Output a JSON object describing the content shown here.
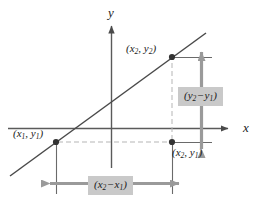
{
  "figure": {
    "type": "slope-diagram",
    "axes": {
      "y_axis_label": "y",
      "x_axis_label": "x"
    },
    "points": [
      {
        "id": "p1",
        "label_prefix": "(",
        "x_var": "x",
        "x_sub": "1",
        "sep": ", ",
        "y_var": "y",
        "y_sub": "1",
        "label_suffix": ")",
        "px": 56,
        "py": 142
      },
      {
        "id": "p2",
        "label_prefix": "(",
        "x_var": "x",
        "x_sub": "2",
        "sep": ", ",
        "y_var": "y",
        "y_sub": "2",
        "label_suffix": ")",
        "px": 172,
        "py": 57
      },
      {
        "id": "p3",
        "label_prefix": "(",
        "x_var": "x",
        "x_sub": "2",
        "sep": ", ",
        "y_var": "y",
        "y_sub": "1",
        "label_suffix": ")",
        "px": 172,
        "py": 142
      }
    ],
    "measures": {
      "rise": {
        "open": "(",
        "v1": "y",
        "s1": "2",
        "op": "−",
        "v2": "y",
        "s2": "1",
        "close": ")"
      },
      "run": {
        "open": "(",
        "v1": "x",
        "s1": "2",
        "op": "−",
        "v2": "x",
        "s2": "1",
        "close": ")"
      }
    },
    "colors": {
      "axis": "#5a5a5a",
      "line": "#4a4a4a",
      "arrow_gray": "#9a9a9a",
      "guide": "#b5b5b5",
      "box_fill": "#c9c9c9",
      "point": "#333333",
      "text": "#1a1a1a",
      "background": "#ffffff"
    }
  }
}
